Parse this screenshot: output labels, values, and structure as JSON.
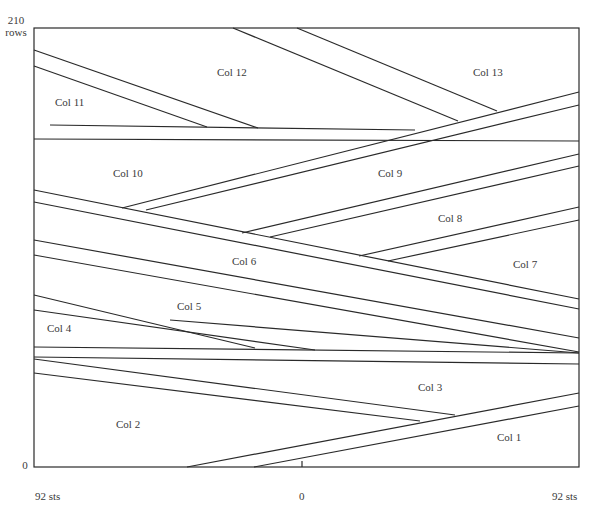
{
  "diagram": {
    "y_axis": {
      "top_label": "210",
      "top_unit": "rows",
      "bottom_label": "0"
    },
    "x_axis": {
      "left_label": "92 sts",
      "center_label": "0",
      "right_label": "92 sts"
    },
    "frame": {
      "left": 34,
      "top": 28,
      "right": 579,
      "bottom": 467
    },
    "line_color": "#2a2a2a",
    "columns": [
      {
        "label": "Col 1",
        "x": 497,
        "y": 431
      },
      {
        "label": "Col 2",
        "x": 116,
        "y": 418
      },
      {
        "label": "Col 3",
        "x": 418,
        "y": 381
      },
      {
        "label": "Col 4",
        "x": 47,
        "y": 322
      },
      {
        "label": "Col 5",
        "x": 177,
        "y": 300
      },
      {
        "label": "Col 6",
        "x": 232,
        "y": 255
      },
      {
        "label": "Col 7",
        "x": 513,
        "y": 258
      },
      {
        "label": "Col 8",
        "x": 438,
        "y": 212
      },
      {
        "label": "Col 9",
        "x": 378,
        "y": 167
      },
      {
        "label": "Col 10",
        "x": 113,
        "y": 167
      },
      {
        "label": "Col 11",
        "x": 55,
        "y": 96
      },
      {
        "label": "Col 12",
        "x": 217,
        "y": 66
      },
      {
        "label": "Col 13",
        "x": 473,
        "y": 66
      }
    ],
    "lines": [
      [
        34,
        50,
        258,
        128
      ],
      [
        34,
        66,
        207,
        127
      ],
      [
        50,
        125,
        415,
        130
      ],
      [
        34,
        139,
        579,
        141
      ],
      [
        233,
        28,
        458,
        121
      ],
      [
        297,
        28,
        497,
        111
      ],
      [
        122,
        208,
        579,
        92
      ],
      [
        146,
        210,
        579,
        105
      ],
      [
        242,
        233,
        579,
        154
      ],
      [
        270,
        237,
        579,
        166
      ],
      [
        359,
        256,
        579,
        207
      ],
      [
        388,
        261,
        579,
        220
      ],
      [
        34,
        190,
        579,
        299
      ],
      [
        34,
        202,
        579,
        309
      ],
      [
        34,
        240,
        579,
        338
      ],
      [
        34,
        255,
        579,
        352
      ],
      [
        34,
        295,
        255,
        348
      ],
      [
        34,
        310,
        315,
        350
      ],
      [
        170,
        320,
        579,
        353
      ],
      [
        34,
        347,
        579,
        353
      ],
      [
        34,
        357,
        579,
        364
      ],
      [
        34,
        359,
        455,
        415
      ],
      [
        34,
        373,
        420,
        421
      ],
      [
        187,
        467,
        579,
        393
      ],
      [
        254,
        467,
        579,
        406
      ],
      [
        302,
        467,
        302,
        461
      ]
    ]
  }
}
